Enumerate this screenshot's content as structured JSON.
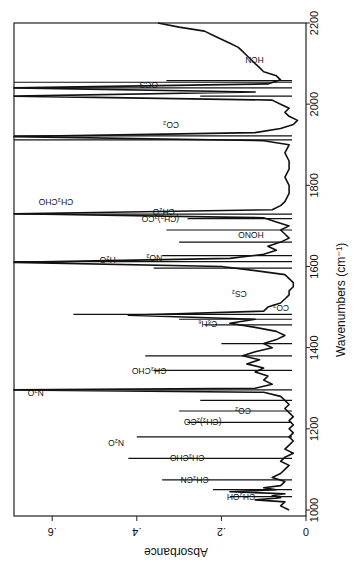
{
  "chart_data": {
    "type": "line",
    "title": "",
    "xlabel": "Wavenumbers (cm⁻¹)",
    "ylabel": "Absorbance",
    "xlim": [
      1000,
      2200
    ],
    "ylim": [
      0,
      0.7
    ],
    "x_ticks": [
      1000,
      1200,
      1400,
      1600,
      1800,
      2000,
      2200
    ],
    "y_ticks": [
      0,
      0.2,
      0.4,
      0.6
    ],
    "y_tick_labels": [
      "0",
      ".2",
      ".4",
      ".6"
    ],
    "orientation": "rotated 90° clockwise (wavenumber axis vertical, absorbance horizontal)",
    "grid": false,
    "legend": null,
    "series": [
      {
        "name": "spectrum",
        "x": [
          1000,
          1010,
          1020,
          1025,
          1030,
          1035,
          1040,
          1045,
          1050,
          1055,
          1060,
          1070,
          1080,
          1090,
          1100,
          1110,
          1120,
          1130,
          1140,
          1150,
          1160,
          1170,
          1180,
          1190,
          1200,
          1210,
          1220,
          1230,
          1240,
          1250,
          1260,
          1270,
          1280,
          1290,
          1296,
          1300,
          1310,
          1320,
          1330,
          1340,
          1350,
          1360,
          1370,
          1380,
          1390,
          1400,
          1410,
          1420,
          1430,
          1440,
          1450,
          1460,
          1470,
          1480,
          1490,
          1500,
          1510,
          1520,
          1530,
          1540,
          1550,
          1560,
          1570,
          1580,
          1590,
          1600,
          1610,
          1620,
          1630,
          1640,
          1650,
          1660,
          1670,
          1680,
          1690,
          1700,
          1710,
          1720,
          1730,
          1740,
          1750,
          1760,
          1780,
          1800,
          1820,
          1840,
          1860,
          1880,
          1900,
          1910,
          1920,
          1930,
          1940,
          1950,
          1960,
          1970,
          1980,
          1990,
          2000,
          2010,
          2020,
          2030,
          2040,
          2050,
          2060,
          2070,
          2080,
          2090,
          2100,
          2110,
          2120,
          2130,
          2140,
          2150,
          2160,
          2170,
          2180,
          2190,
          2200
        ],
        "y": [
          0.04,
          0.06,
          0.05,
          0.12,
          0.06,
          0.08,
          0.05,
          0.18,
          0.07,
          0.1,
          0.06,
          0.05,
          0.08,
          0.06,
          0.05,
          0.04,
          0.06,
          0.05,
          0.03,
          0.05,
          0.04,
          0.03,
          0.04,
          0.03,
          0.04,
          0.03,
          0.04,
          0.03,
          0.04,
          0.05,
          0.04,
          0.05,
          0.06,
          0.1,
          0.7,
          0.12,
          0.08,
          0.1,
          0.09,
          0.12,
          0.1,
          0.14,
          0.11,
          0.15,
          0.12,
          0.08,
          0.1,
          0.07,
          0.05,
          0.07,
          0.12,
          0.18,
          0.12,
          0.42,
          0.1,
          0.09,
          0.06,
          0.05,
          0.04,
          0.04,
          0.03,
          0.03,
          0.04,
          0.05,
          0.12,
          0.2,
          0.7,
          0.18,
          0.1,
          0.07,
          0.09,
          0.06,
          0.04,
          0.05,
          0.06,
          0.04,
          0.07,
          0.1,
          0.7,
          0.08,
          0.06,
          0.05,
          0.04,
          0.04,
          0.05,
          0.04,
          0.04,
          0.05,
          0.04,
          0.1,
          0.7,
          0.12,
          0.06,
          0.03,
          0.02,
          0.04,
          0.05,
          0.04,
          0.06,
          0.08,
          0.7,
          0.12,
          0.7,
          0.09,
          0.06,
          0.07,
          0.1,
          0.11,
          0.12,
          0.13,
          0.14,
          0.15,
          0.16,
          0.18,
          0.2,
          0.22,
          0.24,
          0.3,
          0.35
        ]
      }
    ],
    "peak_lines": [
      {
        "x": 1033,
        "y": 0.18
      },
      {
        "x": 1050,
        "y": 0.22
      },
      {
        "x": 1074,
        "y": 0.34
      },
      {
        "x": 1127,
        "y": 0.42
      },
      {
        "x": 1180,
        "y": 0.4
      },
      {
        "x": 1216,
        "y": 0.28
      },
      {
        "x": 1244,
        "y": 0.3
      },
      {
        "x": 1270,
        "y": 0.25
      },
      {
        "x": 1296,
        "y": 0.7
      },
      {
        "x": 1344,
        "y": 0.36
      },
      {
        "x": 1380,
        "y": 0.38
      },
      {
        "x": 1410,
        "y": 0.2
      },
      {
        "x": 1456,
        "y": 0.24
      },
      {
        "x": 1470,
        "y": 0.3
      },
      {
        "x": 1482,
        "y": 0.55
      },
      {
        "x": 1596,
        "y": 0.36
      },
      {
        "x": 1612,
        "y": 0.7
      },
      {
        "x": 1627,
        "y": 0.34
      },
      {
        "x": 1660,
        "y": 0.3
      },
      {
        "x": 1690,
        "y": 0.33
      },
      {
        "x": 1718,
        "y": 0.28
      },
      {
        "x": 1729,
        "y": 0.7
      },
      {
        "x": 1912,
        "y": 0.7
      },
      {
        "x": 1922,
        "y": 0.7
      },
      {
        "x": 2020,
        "y": 0.25
      },
      {
        "x": 2040,
        "y": 0.7
      },
      {
        "x": 2054,
        "y": 0.7
      },
      {
        "x": 2058,
        "y": 0.33
      }
    ],
    "annotations": [
      {
        "label": "CH₃OH",
        "x": 1034,
        "y": 0.12
      },
      {
        "label": "CH₃CN",
        "x": 1075,
        "y": 0.23
      },
      {
        "label": "CH₃CHO",
        "x": 1130,
        "y": 0.24
      },
      {
        "label": "N₂O",
        "x": 1168,
        "y": 0.43
      },
      {
        "label": "(CH₃)₂CO",
        "x": 1218,
        "y": 0.2
      },
      {
        "label": "CO₂",
        "x": 1245,
        "y": 0.13
      },
      {
        "label": "N₂O",
        "x": 1290,
        "y": 0.62
      },
      {
        "label": "CH₃CHO",
        "x": 1345,
        "y": 0.33
      },
      {
        "label": "C₆H₆",
        "x": 1460,
        "y": 0.21
      },
      {
        "label": "CO₂",
        "x": 1500,
        "y": 0.04
      },
      {
        "label": "CS₂",
        "x": 1535,
        "y": 0.14
      },
      {
        "label": "H₂O",
        "x": 1617,
        "y": 0.45
      },
      {
        "label": "NO₂",
        "x": 1622,
        "y": 0.34
      },
      {
        "label": "HONO",
        "x": 1680,
        "y": 0.1
      },
      {
        "label": "(CH₃)₂CO",
        "x": 1720,
        "y": 0.3
      },
      {
        "label": "CH₂O",
        "x": 1737,
        "y": 0.31
      },
      {
        "label": "CH₃CHO",
        "x": 1760,
        "y": 0.55
      },
      {
        "label": "CO₂",
        "x": 1950,
        "y": 0.3
      },
      {
        "label": "OCS",
        "x": 2050,
        "y": 0.35
      },
      {
        "label": "HCN",
        "x": 2110,
        "y": 0.1
      }
    ]
  },
  "axes": {
    "x_label": "Wavenumbers (cm⁻¹)",
    "y_label": "Absorbance",
    "x_tick_labels": [
      "1000",
      "1200",
      "1400",
      "1600",
      "1800",
      "2000",
      "2200"
    ],
    "y_tick_labels": [
      "0",
      ".2",
      ".4",
      ".6"
    ]
  }
}
